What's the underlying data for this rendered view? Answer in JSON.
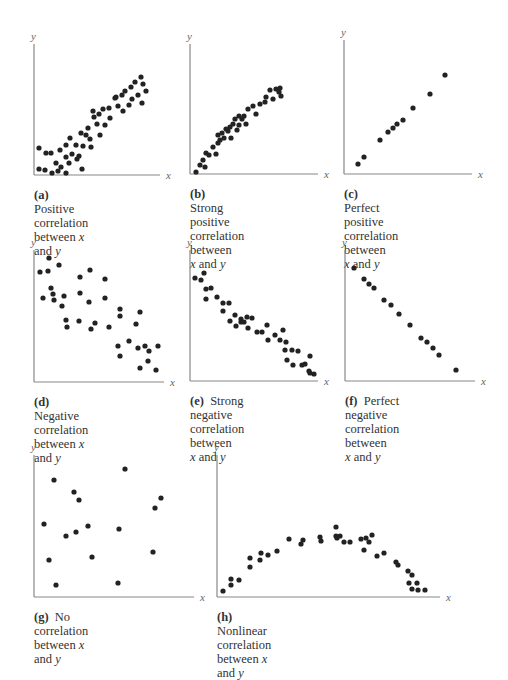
{
  "figure": {
    "dot_color": "#222222",
    "axis_color": "#888888"
  },
  "chart_data": [
    {
      "id": "a",
      "type": "scatter",
      "title": "Positive correlation between x and y",
      "caption_letter": "(a)",
      "caption_text": "Positive correlation",
      "caption_lines": [
        "between ",
        "x",
        " and ",
        "y"
      ],
      "xlabel": "x",
      "ylabel": "y",
      "xlim": [
        0,
        100
      ],
      "ylim": [
        0,
        100
      ],
      "box": {
        "left": 34,
        "top": 44,
        "width": 126,
        "height": 131
      },
      "points": [
        [
          5,
          27
        ],
        [
          5,
          6
        ],
        [
          12,
          22
        ],
        [
          11,
          5
        ],
        [
          17,
          22
        ],
        [
          18,
          2
        ],
        [
          22,
          12
        ],
        [
          26,
          25
        ],
        [
          24,
          4
        ],
        [
          27,
          8
        ],
        [
          32,
          18
        ],
        [
          32,
          2
        ],
        [
          32,
          30
        ],
        [
          35,
          12
        ],
        [
          36,
          37
        ],
        [
          38,
          21
        ],
        [
          42,
          30
        ],
        [
          43,
          16
        ],
        [
          45,
          19
        ],
        [
          47,
          42
        ],
        [
          48,
          6
        ],
        [
          49,
          29
        ],
        [
          52,
          40
        ],
        [
          54,
          47
        ],
        [
          56,
          36
        ],
        [
          57,
          28
        ],
        [
          60,
          58
        ],
        [
          59,
          64
        ],
        [
          63,
          51
        ],
        [
          65,
          61
        ],
        [
          66,
          40
        ],
        [
          69,
          66
        ],
        [
          71,
          50
        ],
        [
          75,
          67
        ],
        [
          76,
          57
        ],
        [
          82,
          78
        ],
        [
          81,
          77
        ],
        [
          84,
          69
        ],
        [
          89,
          64
        ],
        [
          88,
          80
        ],
        [
          91,
          84
        ],
        [
          95,
          70
        ],
        [
          97,
          88
        ],
        [
          101,
          93
        ],
        [
          104,
          80
        ],
        [
          107,
          98
        ],
        [
          109,
          91
        ],
        [
          112,
          84
        ],
        [
          108,
          72
        ],
        [
          98,
          76
        ]
      ]
    },
    {
      "id": "b",
      "type": "scatter",
      "title": "Strong positive correlation between x and y",
      "caption_letter": "(b)",
      "caption_text": "Strong positive",
      "caption_lines": [
        "correlation between",
        "x",
        " and ",
        "y"
      ],
      "xlabel": "x",
      "ylabel": "y",
      "xlim": [
        0,
        100
      ],
      "ylim": [
        0,
        100
      ],
      "box": {
        "left": 190,
        "top": 44,
        "width": 128,
        "height": 130
      },
      "points": [
        [
          6,
          2
        ],
        [
          10,
          9
        ],
        [
          13,
          14
        ],
        [
          16,
          21
        ],
        [
          15,
          7
        ],
        [
          19,
          19
        ],
        [
          23,
          27
        ],
        [
          26,
          20
        ],
        [
          28,
          31
        ],
        [
          30,
          34
        ],
        [
          28,
          39
        ],
        [
          32,
          41
        ],
        [
          34,
          36
        ],
        [
          36,
          45
        ],
        [
          38,
          43
        ],
        [
          40,
          47
        ],
        [
          41,
          36
        ],
        [
          43,
          50
        ],
        [
          45,
          55
        ],
        [
          47,
          44
        ],
        [
          49,
          58
        ],
        [
          49,
          49
        ],
        [
          52,
          55
        ],
        [
          54,
          58
        ],
        [
          56,
          50
        ],
        [
          58,
          65
        ],
        [
          63,
          68
        ],
        [
          66,
          60
        ],
        [
          70,
          70
        ],
        [
          75,
          72
        ],
        [
          76,
          77
        ],
        [
          80,
          84
        ],
        [
          83,
          75
        ],
        [
          86,
          85
        ],
        [
          89,
          82
        ],
        [
          91,
          78
        ],
        [
          90,
          86
        ]
      ]
    },
    {
      "id": "c",
      "type": "scatter",
      "title": "Perfect positive correlation between x and y",
      "caption_letter": "(c)",
      "caption_text": "Perfect positive",
      "caption_lines": [
        "correlation between",
        "x",
        " and ",
        "y"
      ],
      "xlabel": "x",
      "ylabel": "y",
      "xlim": [
        0,
        100
      ],
      "ylim": [
        0,
        100
      ],
      "box": {
        "left": 344,
        "top": 40,
        "width": 128,
        "height": 134
      },
      "points": [
        [
          14,
          10
        ],
        [
          20,
          17
        ],
        [
          36,
          34
        ],
        [
          44,
          42
        ],
        [
          49,
          46
        ],
        [
          53,
          50
        ],
        [
          59,
          54
        ],
        [
          69,
          66
        ],
        [
          86,
          80
        ],
        [
          101,
          99
        ]
      ]
    },
    {
      "id": "d",
      "type": "scatter",
      "title": "Negative correlation between x and y",
      "caption_letter": "(d)",
      "caption_text": "Negative correlation",
      "caption_lines": [
        "between ",
        "x",
        " and ",
        "y"
      ],
      "xlabel": "x",
      "ylabel": "y",
      "xlim": [
        0,
        100
      ],
      "ylim": [
        0,
        100
      ],
      "box": {
        "left": 34,
        "top": 250,
        "width": 130,
        "height": 132
      },
      "points": [
        [
          6,
          110
        ],
        [
          15,
          124
        ],
        [
          9,
          84
        ],
        [
          14,
          111
        ],
        [
          17,
          94
        ],
        [
          19,
          88
        ],
        [
          20,
          82
        ],
        [
          25,
          117
        ],
        [
          28,
          76
        ],
        [
          30,
          86
        ],
        [
          32,
          62
        ],
        [
          33,
          55
        ],
        [
          46,
          105
        ],
        [
          46,
          89
        ],
        [
          45,
          61
        ],
        [
          55,
          80
        ],
        [
          56,
          112
        ],
        [
          57,
          53
        ],
        [
          61,
          59
        ],
        [
          71,
          103
        ],
        [
          71,
          84
        ],
        [
          75,
          55
        ],
        [
          86,
          73
        ],
        [
          86,
          66
        ],
        [
          84,
          36
        ],
        [
          86,
          26
        ],
        [
          95,
          41
        ],
        [
          104,
          34
        ],
        [
          102,
          58
        ],
        [
          106,
          70
        ],
        [
          111,
          36
        ],
        [
          115,
          31
        ],
        [
          114,
          21
        ],
        [
          124,
          36
        ],
        [
          122,
          12
        ],
        [
          106,
          14
        ]
      ]
    },
    {
      "id": "e",
      "type": "scatter",
      "title": "Strong negative correlation between x and y",
      "caption_letter": "(e)",
      "caption_text": "Strong negative",
      "caption_lines": [
        "correlation between",
        "x",
        " and ",
        "y"
      ],
      "xlabel": "x",
      "ylabel": "y",
      "xlim": [
        0,
        100
      ],
      "ylim": [
        0,
        100
      ],
      "box": {
        "left": 190,
        "top": 250,
        "width": 128,
        "height": 131
      },
      "points": [
        [
          5,
          103
        ],
        [
          11,
          101
        ],
        [
          14,
          108
        ],
        [
          16,
          92
        ],
        [
          16,
          82
        ],
        [
          21,
          93
        ],
        [
          27,
          84
        ],
        [
          33,
          78
        ],
        [
          33,
          70
        ],
        [
          39,
          78
        ],
        [
          40,
          60
        ],
        [
          45,
          66
        ],
        [
          46,
          55
        ],
        [
          51,
          59
        ],
        [
          51,
          62
        ],
        [
          54,
          59
        ],
        [
          58,
          53
        ],
        [
          57,
          64
        ],
        [
          62,
          63
        ],
        [
          67,
          49
        ],
        [
          72,
          49
        ],
        [
          77,
          56
        ],
        [
          78,
          41
        ],
        [
          85,
          46
        ],
        [
          90,
          41
        ],
        [
          93,
          51
        ],
        [
          95,
          31
        ],
        [
          96,
          39
        ],
        [
          97,
          21
        ],
        [
          102,
          31
        ],
        [
          108,
          30
        ],
        [
          103,
          16
        ],
        [
          112,
          16
        ],
        [
          115,
          17
        ],
        [
          119,
          10
        ],
        [
          120,
          8
        ],
        [
          124,
          7
        ],
        [
          120,
          25
        ]
      ]
    },
    {
      "id": "f",
      "type": "scatter",
      "title": "Perfect negative correlation between x and y",
      "caption_letter": "(f)",
      "caption_text": "Perfect negative",
      "caption_lines": [
        "correlation between",
        "x",
        " and ",
        "y"
      ],
      "xlabel": "x",
      "ylabel": "y",
      "xlim": [
        0,
        100
      ],
      "ylim": [
        0,
        100
      ],
      "box": {
        "left": 345,
        "top": 250,
        "width": 130,
        "height": 131
      },
      "points": [
        [
          9,
          113
        ],
        [
          19,
          102
        ],
        [
          24,
          97
        ],
        [
          29,
          93
        ],
        [
          39,
          81
        ],
        [
          46,
          76
        ],
        [
          54,
          67
        ],
        [
          65,
          56
        ],
        [
          76,
          43
        ],
        [
          82,
          39
        ],
        [
          88,
          33
        ],
        [
          94,
          26
        ],
        [
          111,
          11
        ]
      ]
    },
    {
      "id": "g",
      "type": "scatter",
      "title": "No correlation between x and y",
      "caption_letter": "(g)",
      "caption_text": "No correlation",
      "caption_lines": [
        "between ",
        "x",
        " and ",
        "y"
      ],
      "xlabel": "x",
      "ylabel": "y",
      "xlim": [
        0,
        100
      ],
      "ylim": [
        0,
        100
      ],
      "box": {
        "left": 34,
        "top": 455,
        "width": 160,
        "height": 142
      },
      "points": [
        [
          10,
          73
        ],
        [
          20,
          117
        ],
        [
          40,
          105
        ],
        [
          45,
          97
        ],
        [
          32,
          61
        ],
        [
          54,
          71
        ],
        [
          42,
          65
        ],
        [
          15,
          37
        ],
        [
          58,
          40
        ],
        [
          22,
          12
        ],
        [
          91,
          128
        ],
        [
          85,
          68
        ],
        [
          121,
          89
        ],
        [
          127,
          99
        ],
        [
          119,
          45
        ],
        [
          84,
          14
        ]
      ]
    },
    {
      "id": "h",
      "type": "scatter",
      "title": "Nonlinear correlation between x and y",
      "caption_letter": "(h)",
      "caption_text": "Nonlinear correlation",
      "caption_lines": [
        "between ",
        "x",
        " and ",
        "y"
      ],
      "xlabel": "x",
      "ylabel": "y",
      "xlim": [
        0,
        100
      ],
      "ylim": [
        0,
        100
      ],
      "box": {
        "left": 217,
        "top": 455,
        "width": 223,
        "height": 142
      },
      "points": [
        [
          6,
          6
        ],
        [
          14,
          12
        ],
        [
          14,
          18
        ],
        [
          22,
          17
        ],
        [
          33,
          30
        ],
        [
          33,
          39
        ],
        [
          43,
          37
        ],
        [
          44,
          44
        ],
        [
          51,
          42
        ],
        [
          60,
          46
        ],
        [
          72,
          58
        ],
        [
          86,
          57
        ],
        [
          84,
          53
        ],
        [
          104,
          56
        ],
        [
          103,
          60
        ],
        [
          119,
          70
        ],
        [
          120,
          59
        ],
        [
          119,
          61
        ],
        [
          123,
          61
        ],
        [
          127,
          55
        ],
        [
          133,
          55
        ],
        [
          144,
          58
        ],
        [
          147,
          47
        ],
        [
          152,
          55
        ],
        [
          149,
          59
        ],
        [
          155,
          62
        ],
        [
          160,
          41
        ],
        [
          167,
          44
        ],
        [
          179,
          35
        ],
        [
          181,
          32
        ],
        [
          191,
          26
        ],
        [
          192,
          14
        ],
        [
          195,
          22
        ],
        [
          200,
          14
        ],
        [
          201,
          7
        ],
        [
          195,
          8
        ],
        [
          208,
          7
        ]
      ]
    }
  ]
}
